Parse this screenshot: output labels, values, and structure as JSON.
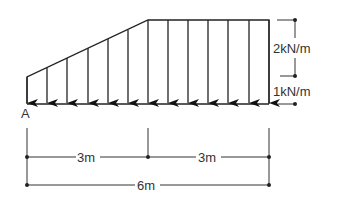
{
  "diagram": {
    "type": "distributed-load-beam",
    "support_label": "A",
    "loads": {
      "uniform_extra_label": "2kN/m",
      "base_label": "1kN/m"
    },
    "dimensions": {
      "left_span": "3m",
      "right_span": "3m",
      "total_span": "6m"
    },
    "colors": {
      "line": "#222222",
      "text": "#333333"
    }
  }
}
